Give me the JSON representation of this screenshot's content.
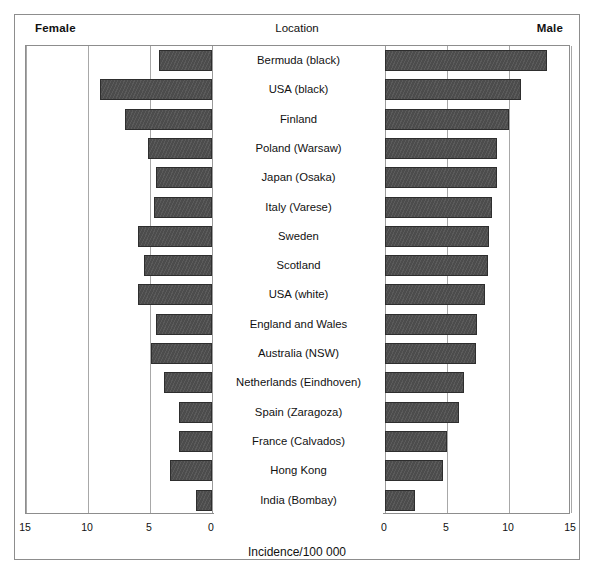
{
  "header": {
    "left_label": "Female",
    "center_label": "Location",
    "right_label": "Male"
  },
  "axis": {
    "title": "Incidence/100 000",
    "female_ticks": [
      "15",
      "10",
      "5",
      "0"
    ],
    "male_ticks": [
      "0",
      "5",
      "10",
      "15"
    ]
  },
  "colors": {
    "bar_fill": "#4c4c4c",
    "bar_edge": "#2e2e2e",
    "grid": "#a8a8a8",
    "frame": "#8d8d8d",
    "text": "#111111"
  },
  "chart_data": {
    "type": "bar",
    "orientation": "horizontal",
    "style": "population-pyramid",
    "title": "",
    "xlabel": "Incidence/100 000",
    "ylabel": "Location",
    "xlim": [
      0,
      15
    ],
    "grid": true,
    "legend_position": "top",
    "categories": [
      "Bermuda (black)",
      "USA (black)",
      "Finland",
      "Poland (Warsaw)",
      "Japan (Osaka)",
      "Italy (Varese)",
      "Sweden",
      "Scotland",
      "USA (white)",
      "England and Wales",
      "Australia (NSW)",
      "Netherlands (Eindhoven)",
      "Spain (Zaragoza)",
      "France (Calvados)",
      "Hong Kong",
      "India (Bombay)"
    ],
    "series": [
      {
        "name": "Female",
        "side": "left",
        "values": [
          4.3,
          9.0,
          7.0,
          5.2,
          4.5,
          4.7,
          6.0,
          5.5,
          6.0,
          4.5,
          4.9,
          3.9,
          2.7,
          2.7,
          3.4,
          1.3
        ]
      },
      {
        "name": "Male",
        "side": "right",
        "values": [
          13.1,
          11.0,
          10.0,
          9.0,
          9.0,
          8.6,
          8.4,
          8.3,
          8.1,
          7.4,
          7.3,
          6.4,
          6.0,
          5.0,
          4.7,
          2.4
        ]
      }
    ]
  }
}
